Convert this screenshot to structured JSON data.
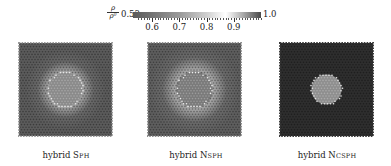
{
  "chart_data": {
    "type": "heatmap",
    "title": "",
    "colorbar": {
      "label_numerator": "ρ",
      "label_denominator": "ρ⁰",
      "min": 0.53,
      "max": 1.0,
      "min_label": "0.53",
      "max_label": "1.0",
      "ticks": [
        0.6,
        0.7,
        0.8,
        0.9
      ],
      "tick_labels": [
        "0.6",
        "0.7",
        "0.8",
        "0.9"
      ],
      "colormap": "diverging-gray (dark at ends, white near 0.87)",
      "stops": [
        {
          "value": 0.53,
          "color": "#5a5a5a"
        },
        {
          "value": 0.7,
          "color": "#9a9a9a"
        },
        {
          "value": 0.8,
          "color": "#cfcfcf"
        },
        {
          "value": 0.87,
          "color": "#ffffff"
        },
        {
          "value": 0.93,
          "color": "#b0b0b0"
        },
        {
          "value": 1.0,
          "color": "#4a4a4a"
        }
      ]
    },
    "panels": [
      {
        "caption_prefix": "hybrid ",
        "caption_method": "Sph",
        "description": "Square particle domain with central inclusion; medium-dark gray bulk, bright ring around jagged central circle, lighter boundary particles",
        "bulk_color": "#5b5b5b",
        "inclusion_color": "#8a8a8a",
        "ring_color": "#e8e8e8",
        "edge_color": "#9a9a9a"
      },
      {
        "caption_prefix": "hybrid ",
        "caption_method": "Nsph",
        "description": "Square particle domain; gray bulk with lighter radial streaks, bright halo around central circle",
        "bulk_color": "#5e5e5e",
        "inclusion_color": "#7a7a7a",
        "ring_color": "#f0f0f0",
        "edge_color": "#8c8c8c"
      },
      {
        "caption_prefix": "hybrid ",
        "caption_method": "Ncsph",
        "description": "Square particle domain; very dark uniform bulk, mid-gray central circle with bright rim",
        "bulk_color": "#2e2e2e",
        "inclusion_color": "#8e8e8e",
        "ring_color": "#e6e6e6",
        "edge_color": "#3a3a3a"
      }
    ],
    "xlabel": "",
    "ylabel": "",
    "grid": false,
    "legend_position": "top (horizontal colorbar)"
  },
  "captions": [
    {
      "prefix": "hybrid ",
      "method": "Sph"
    },
    {
      "prefix": "hybrid ",
      "method": "Nsph"
    },
    {
      "prefix": "hybrid ",
      "method": "Ncsph"
    }
  ]
}
